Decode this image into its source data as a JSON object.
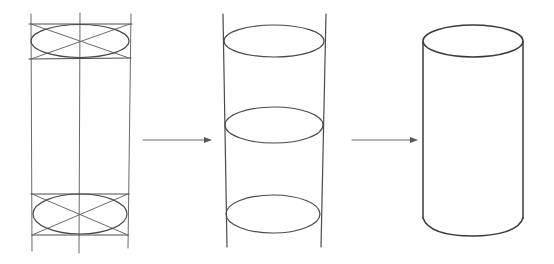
{
  "diagram": {
    "title": "Drawing a cylinder in three stages",
    "stroke_color": "#4a4a4a",
    "background": "#ffffff",
    "stages": [
      {
        "id": "stage-1",
        "label": "Construction guides: bounding lines, center axis, boxed ellipses with diagonals",
        "bounds": {
          "x1": 31,
          "x2": 130,
          "y1": 14,
          "y2": 252
        },
        "axis_x": 80,
        "top_box": {
          "y1": 24,
          "y2": 59
        },
        "bottom_box": {
          "y1": 194,
          "y2": 235
        }
      },
      {
        "id": "stage-2",
        "label": "Guide lines with three ellipses",
        "bounds": {
          "x1": 224,
          "x2": 325,
          "y1": 14,
          "y2": 247
        },
        "ellipses": [
          {
            "cx": 274,
            "cy": 41,
            "rx": 50,
            "ry": 16
          },
          {
            "cx": 274,
            "cy": 125,
            "rx": 49,
            "ry": 18
          },
          {
            "cx": 273,
            "cy": 214,
            "rx": 47,
            "ry": 19
          }
        ]
      },
      {
        "id": "stage-3",
        "label": "Finished cylinder outline",
        "top_ellipse": {
          "cx": 473,
          "cy": 41,
          "rx": 50,
          "ry": 16
        },
        "sides": {
          "x1": 423,
          "x2": 523,
          "y_top": 41,
          "y_bottom": 218
        },
        "bottom_arc_y": 236
      }
    ],
    "arrows": [
      {
        "id": "arrow-1",
        "x1": 143,
        "x2": 212,
        "y": 140
      },
      {
        "id": "arrow-2",
        "x1": 352,
        "x2": 418,
        "y": 140
      }
    ]
  }
}
